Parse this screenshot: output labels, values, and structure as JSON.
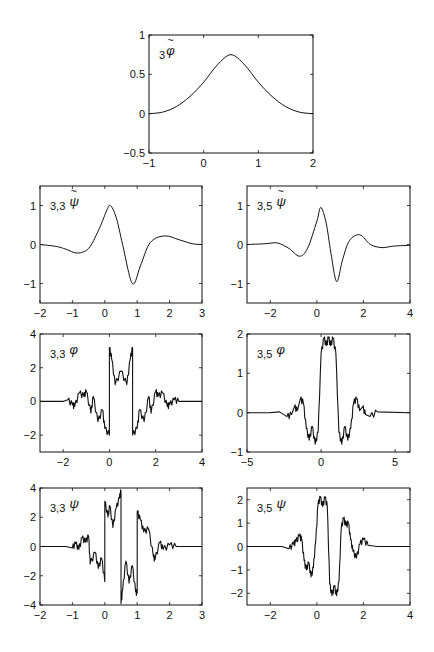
{
  "figure": {
    "background": "#ffffff",
    "line_color": "#111111"
  },
  "chart_data": [
    {
      "id": "phi_tilde_3",
      "type": "line",
      "label": {
        "prefix": "3",
        "symbol": "φ",
        "tilde": true
      },
      "box": [
        149,
        35,
        313,
        153
      ],
      "xlim": [
        -1,
        2
      ],
      "ylim": [
        -0.5,
        1
      ],
      "xticks": [
        -1,
        0,
        1,
        2
      ],
      "yticks": [
        -0.5,
        0,
        0.5,
        1
      ],
      "xticklabels": [
        "−1",
        "0",
        "1",
        "2"
      ],
      "yticklabels": [
        "−0.5",
        "0",
        "0.5",
        "1"
      ],
      "curve": "bump",
      "x": [
        -1,
        -0.75,
        -0.5,
        -0.25,
        0,
        0.25,
        0.5,
        0.75,
        1,
        1.25,
        1.5,
        1.75,
        2
      ],
      "y": [
        0,
        0.02,
        0.09,
        0.22,
        0.4,
        0.62,
        0.75,
        0.62,
        0.4,
        0.22,
        0.09,
        0.02,
        0
      ]
    },
    {
      "id": "psi_tilde_33",
      "type": "line",
      "label": {
        "prefix": "3,3",
        "symbol": "ψ",
        "tilde": true
      },
      "box": [
        40,
        186,
        202,
        303
      ],
      "xlim": [
        -2,
        3
      ],
      "ylim": [
        -1.5,
        1.5
      ],
      "xticks": [
        -2,
        -1,
        0,
        1,
        2,
        3
      ],
      "yticks": [
        -1,
        0,
        1
      ],
      "xticklabels": [
        "−2",
        "−1",
        "0",
        "1",
        "2",
        "3"
      ],
      "yticklabels": [
        "−1",
        "0",
        "1"
      ],
      "curve": "smooth",
      "x": [
        -2,
        -1.5,
        -1.2,
        -0.85,
        -0.5,
        -0.2,
        0.05,
        0.17,
        0.35,
        0.55,
        0.85,
        1.1,
        1.4,
        1.85,
        2.3,
        2.7,
        3
      ],
      "y": [
        0,
        -0.05,
        -0.12,
        -0.22,
        -0.1,
        0.35,
        0.85,
        1.0,
        0.7,
        0.0,
        -1.0,
        -0.55,
        0.05,
        0.22,
        0.12,
        0.02,
        0
      ]
    },
    {
      "id": "psi_tilde_35",
      "type": "line",
      "label": {
        "prefix": "3,5",
        "symbol": "ψ",
        "tilde": true
      },
      "box": [
        247,
        186,
        410,
        303
      ],
      "xlim": [
        -3,
        4
      ],
      "ylim": [
        -1.5,
        1.5
      ],
      "xticks": [
        -2,
        0,
        2,
        4
      ],
      "yticks": [
        -1,
        0,
        1
      ],
      "xticklabels": [
        "−2",
        "0",
        "2",
        "4"
      ],
      "yticklabels": [
        "−1",
        "0",
        "1"
      ],
      "curve": "smooth",
      "x": [
        -3,
        -2.2,
        -1.7,
        -1.2,
        -0.75,
        -0.4,
        0,
        0.17,
        0.4,
        0.6,
        0.85,
        1.1,
        1.4,
        1.85,
        2.3,
        2.8,
        3.3,
        4
      ],
      "y": [
        0,
        0.02,
        0.04,
        -0.1,
        -0.3,
        -0.1,
        0.6,
        0.95,
        0.55,
        -0.2,
        -0.95,
        -0.4,
        0.1,
        0.25,
        0.0,
        -0.08,
        -0.04,
        -0.02
      ]
    },
    {
      "id": "phi_33",
      "type": "line",
      "label": {
        "prefix": "3,3",
        "symbol": "φ",
        "tilde": false
      },
      "box": [
        40,
        334,
        202,
        452
      ],
      "xlim": [
        -3,
        4
      ],
      "ylim": [
        -3,
        4
      ],
      "xticks": [
        -2,
        0,
        2,
        4
      ],
      "yticks": [
        -2,
        0,
        2,
        4
      ],
      "xticklabels": [
        "−2",
        "0",
        "2",
        "4"
      ],
      "yticklabels": [
        "−2",
        "0",
        "2",
        "4"
      ],
      "curve": "fractal",
      "x": [
        -3,
        -2,
        -1.8,
        -1.6,
        -1.5,
        -1.3,
        -1.1,
        -1.0,
        -0.8,
        -0.7,
        -0.5,
        -0.3,
        -0.2,
        0,
        0,
        0.1,
        0.25,
        0.5,
        0.75,
        0.9,
        1,
        1,
        1.2,
        1.3,
        1.5,
        1.7,
        1.8,
        2,
        2.1,
        2.3,
        2.5,
        2.6,
        2.8,
        3,
        4
      ],
      "y": [
        0,
        0,
        0.1,
        -0.2,
        -0.3,
        0.5,
        0.3,
        0.6,
        -0.7,
        0.3,
        -1.2,
        -0.5,
        -1.6,
        -2.0,
        3.2,
        2.5,
        1.0,
        1.8,
        1.0,
        2.5,
        3.2,
        -2.0,
        -1.6,
        -0.5,
        -1.2,
        0.3,
        -0.7,
        0.6,
        0.3,
        0.5,
        -0.3,
        -0.2,
        0.1,
        0,
        0
      ]
    },
    {
      "id": "phi_35",
      "type": "line",
      "label": {
        "prefix": "3,5",
        "symbol": "φ",
        "tilde": false
      },
      "box": [
        247,
        334,
        410,
        452
      ],
      "xlim": [
        -5,
        6
      ],
      "ylim": [
        -1,
        2
      ],
      "xticks": [
        -5,
        0,
        5
      ],
      "yticks": [
        -1,
        0,
        1,
        2
      ],
      "xticklabels": [
        "−5",
        "0",
        "5"
      ],
      "yticklabels": [
        "−1",
        "0",
        "1",
        "2"
      ],
      "curve": "fractal",
      "x": [
        -5,
        -3.5,
        -2.8,
        -2.3,
        -2.0,
        -1.8,
        -1.6,
        -1.4,
        -1.2,
        -1.0,
        -0.8,
        -0.6,
        -0.4,
        -0.2,
        0,
        0.2,
        0.35,
        0.5,
        0.65,
        0.8,
        1.0,
        1.2,
        1.4,
        1.6,
        1.8,
        2.0,
        2.2,
        2.4,
        2.6,
        2.8,
        3.0,
        3.3,
        3.8,
        6
      ],
      "y": [
        0,
        0,
        0.02,
        -0.1,
        -0.05,
        0.15,
        0.05,
        0.35,
        0.25,
        -0.4,
        -0.7,
        -0.35,
        -0.8,
        -0.5,
        1.5,
        1.9,
        1.7,
        1.9,
        1.7,
        1.9,
        1.5,
        -0.5,
        -0.8,
        -0.35,
        -0.7,
        -0.4,
        0.25,
        0.35,
        0.05,
        0.15,
        -0.05,
        -0.1,
        0.02,
        0
      ]
    },
    {
      "id": "psi_33",
      "type": "line",
      "label": {
        "prefix": "3,3",
        "symbol": "ψ",
        "tilde": false
      },
      "box": [
        40,
        488,
        202,
        605
      ],
      "xlim": [
        -2,
        3
      ],
      "ylim": [
        -4,
        4
      ],
      "xticks": [
        -2,
        -1,
        0,
        1,
        2,
        3
      ],
      "yticks": [
        -4,
        -2,
        0,
        2,
        4
      ],
      "xticklabels": [
        "−2",
        "−1",
        "0",
        "1",
        "2",
        "3"
      ],
      "yticklabels": [
        "−4",
        "−2",
        "0",
        "2",
        "4"
      ],
      "curve": "fractal",
      "x": [
        -2,
        -1.2,
        -1.0,
        -0.9,
        -0.8,
        -0.7,
        -0.6,
        -0.5,
        -0.45,
        -0.3,
        -0.2,
        -0.1,
        0,
        0,
        0.1,
        0.15,
        0.25,
        0.35,
        0.45,
        0.5,
        0.5,
        0.55,
        0.65,
        0.75,
        0.85,
        0.95,
        1.0,
        1.0,
        1.1,
        1.2,
        1.35,
        1.5,
        1.55,
        1.7,
        1.8,
        2.0,
        2.2,
        3
      ],
      "y": [
        0,
        0,
        -0.1,
        0.2,
        -0.2,
        0.6,
        0.3,
        0.7,
        -1.2,
        -0.4,
        -1.5,
        -0.8,
        -2.4,
        3.1,
        2.0,
        2.8,
        1.3,
        2.6,
        3.3,
        3.8,
        -3.9,
        -3.0,
        -1.0,
        -2.5,
        -1.3,
        -3.1,
        -3.2,
        2.4,
        1.8,
        1.0,
        1.2,
        -0.7,
        -0.9,
        0.3,
        -0.2,
        0.1,
        0,
        0
      ]
    },
    {
      "id": "psi_35",
      "type": "line",
      "label": {
        "prefix": "3,5",
        "symbol": "ψ",
        "tilde": false
      },
      "box": [
        247,
        488,
        410,
        605
      ],
      "xlim": [
        -3,
        4
      ],
      "ylim": [
        -2.5,
        2.5
      ],
      "xticks": [
        -2,
        0,
        2,
        4
      ],
      "yticks": [
        -2,
        -1,
        0,
        1,
        2
      ],
      "xticklabels": [
        "−2",
        "0",
        "2",
        "4"
      ],
      "yticklabels": [
        "−2",
        "−1",
        "0",
        "1",
        "2"
      ],
      "curve": "fractal",
      "x": [
        -3,
        -1.5,
        -1.2,
        -1.0,
        -0.9,
        -0.75,
        -0.65,
        -0.55,
        -0.45,
        -0.35,
        -0.25,
        -0.15,
        -0.05,
        0.05,
        0.15,
        0.25,
        0.35,
        0.45,
        0.55,
        0.65,
        0.75,
        0.85,
        0.95,
        1.05,
        1.15,
        1.25,
        1.35,
        1.45,
        1.55,
        1.7,
        1.85,
        2.0,
        2.2,
        2.6,
        4
      ],
      "y": [
        0,
        0,
        -0.1,
        0.1,
        0.2,
        0.45,
        0.3,
        -0.6,
        -1.0,
        -0.7,
        -1.3,
        -0.9,
        0.2,
        1.8,
        2.1,
        1.7,
        2.1,
        1.7,
        -1.6,
        -2.1,
        -1.7,
        -2.1,
        -1.5,
        0.8,
        1.2,
        0.9,
        1.0,
        0.3,
        -0.2,
        -0.5,
        0.1,
        0.3,
        0.05,
        0,
        0
      ]
    }
  ]
}
